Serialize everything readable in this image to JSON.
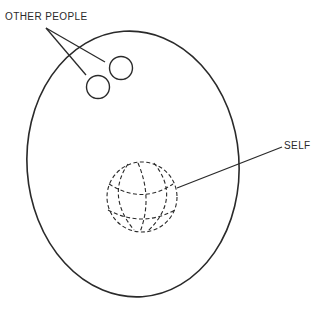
{
  "diagram": {
    "labels": {
      "other_people": "OTHER PEOPLE",
      "self": "SELF"
    },
    "elements": {
      "outer_boundary": "large ellipse",
      "other_people_markers": [
        "small circle",
        "small circle"
      ],
      "self_marker": "dashed wireframe globe"
    },
    "colors": {
      "stroke": "#2a2a2a",
      "background": "#ffffff"
    }
  }
}
